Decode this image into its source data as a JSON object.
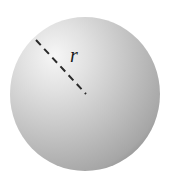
{
  "diagram": {
    "shape": "sphere",
    "radius_label": "r",
    "colors": {
      "sphere_highlight": "#f4f4f4",
      "sphere_mid": "#c4c4c4",
      "sphere_edge": "#8e8e8e",
      "radius_line": "#2a2a2a",
      "label": "#1a1a1a"
    }
  }
}
